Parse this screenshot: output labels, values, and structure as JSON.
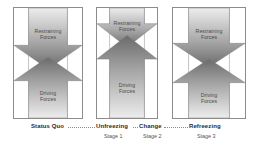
{
  "diagram": {
    "colors": {
      "arrow_dark": "#6e6e6e",
      "arrow_light": "#e4e4e4",
      "panel_border": "#8c8c8c",
      "label_text": "#4a4a4a",
      "stage_title_text": "#2b2b2b",
      "stage_sub_text": "#555555",
      "background": "#ffffff"
    },
    "panels": [
      {
        "id": "panel-status-quo",
        "restraining_label": "Restraining\nForces",
        "restraining_line1": "Restraining",
        "restraining_line2": "Forces",
        "driving_label": "Driving\nForces",
        "driving_line1": "Driving",
        "driving_line2": "Forces",
        "equilibrium_position": "center",
        "description": "Equal and opposing forces meet at the middle"
      },
      {
        "id": "panel-change",
        "restraining_line1": "Restraining",
        "restraining_line2": "Forces",
        "driving_line1": "Driving",
        "driving_line2": "Forces",
        "equilibrium_position": "high",
        "description": "Restraining forces reduced, driving forces expanded upward"
      },
      {
        "id": "panel-refreezing",
        "restraining_line1": "Restraining",
        "restraining_line2": "Forces",
        "driving_line1": "Driving",
        "driving_line2": "Forces",
        "equilibrium_position": "center",
        "description": "Forces re-balanced at new equilibrium"
      }
    ],
    "timeline": {
      "stages": [
        {
          "title": "Status Quo",
          "sub": ""
        },
        {
          "title": "Unfreezing",
          "sub": "Stage 1"
        },
        {
          "title": "Change",
          "sub": "Stage 2"
        },
        {
          "title": "Refreezing",
          "sub": "Stage 3"
        }
      ]
    }
  }
}
